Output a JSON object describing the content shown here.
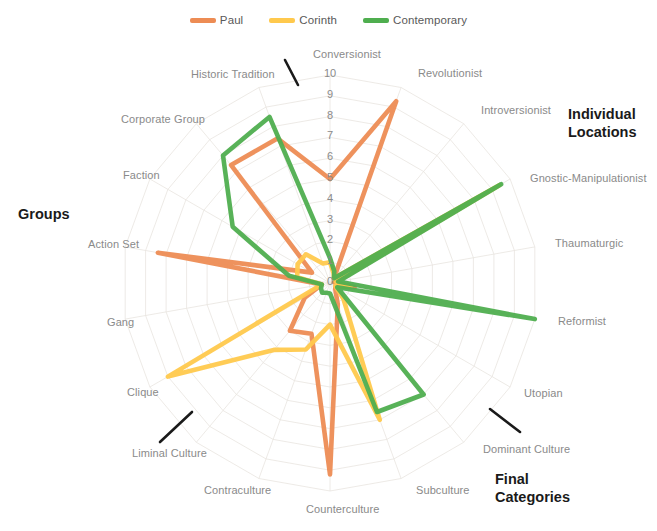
{
  "legend": {
    "position": "top-center",
    "items": [
      {
        "label": "Paul",
        "color": "#ED8C54"
      },
      {
        "label": "Corinth",
        "color": "#FFC94D"
      },
      {
        "label": "Contemporary",
        "color": "#4FAE4F"
      }
    ]
  },
  "sections": [
    {
      "key": "individual_locations",
      "label": "Individual Locations",
      "line1": "Individual",
      "line2": "Locations"
    },
    {
      "key": "final_categories",
      "label": "Final Categories",
      "line1": "Final",
      "line2": "Categories"
    },
    {
      "key": "groups",
      "label": "Groups",
      "line1": "Groups",
      "line2": ""
    }
  ],
  "ticks": [
    "0",
    "1",
    "2",
    "3",
    "4",
    "5",
    "6",
    "7",
    "8",
    "9",
    "10"
  ],
  "chart_data": {
    "type": "radar",
    "title": "",
    "subtitle": "",
    "xlabel": "",
    "ylabel": "",
    "rlim": [
      0,
      10
    ],
    "rticks": [
      0,
      1,
      2,
      3,
      4,
      5,
      6,
      7,
      8,
      9,
      10
    ],
    "grid": true,
    "legend_position": "top-center",
    "start_angle_deg": 90,
    "direction": "clockwise",
    "categories": [
      "Conversionist",
      "Revolutionist",
      "Introversionist",
      "Gnostic-Manipulationist",
      "Thaumaturgic",
      "Reformist",
      "Utopian",
      "Dominant Culture",
      "Subculture",
      "Counterculture",
      "Contraculture",
      "Liminal Culture",
      "Clique",
      "Gang",
      "Action Set",
      "Faction",
      "Corporate Group",
      "Historic Tradition"
    ],
    "series": [
      {
        "name": "Paul",
        "color": "#ED8C54",
        "values": [
          5,
          9.3,
          0.3,
          0.6,
          0.2,
          1.2,
          0.3,
          0.4,
          1.1,
          9.2,
          2.6,
          3.0,
          1.4,
          0.4,
          8.4,
          1.0,
          7.4,
          7.4
        ]
      },
      {
        "name": "Corinth",
        "color": "#FFC94D",
        "values": [
          1.0,
          0.5,
          0.3,
          9.4,
          0.3,
          1.0,
          0.3,
          1.0,
          7.0,
          2.0,
          3.4,
          4.2,
          9.0,
          0.4,
          1.6,
          1.8,
          1.8,
          1.0
        ]
      },
      {
        "name": "Contemporary",
        "color": "#4FAE4F",
        "values": [
          1.2,
          0.6,
          0.3,
          9.5,
          0.4,
          10.0,
          0.4,
          7.0,
          6.6,
          0.5,
          0.5,
          0.6,
          0.5,
          0.4,
          2.0,
          5.4,
          8.0,
          8.5
        ]
      }
    ]
  },
  "axis_label_positions": [
    {
      "name": "Conversionist",
      "x": 313,
      "y": 48,
      "align": "left"
    },
    {
      "name": "Revolutionist",
      "x": 418,
      "y": 67,
      "align": "left"
    },
    {
      "name": "Introversionist",
      "x": 481,
      "y": 104,
      "align": "left"
    },
    {
      "name": "Gnostic-Manipulationist",
      "x": 530,
      "y": 172,
      "align": "left"
    },
    {
      "name": "Thaumaturgic",
      "x": 555,
      "y": 237,
      "align": "left"
    },
    {
      "name": "Reformist",
      "x": 558,
      "y": 315,
      "align": "left"
    },
    {
      "name": "Utopian",
      "x": 524,
      "y": 387,
      "align": "left"
    },
    {
      "name": "Dominant Culture",
      "x": 483,
      "y": 443,
      "align": "left"
    },
    {
      "name": "Subculture",
      "x": 416,
      "y": 484,
      "align": "left"
    },
    {
      "name": "Counterculture",
      "x": 306,
      "y": 503,
      "align": "left"
    },
    {
      "name": "Contraculture",
      "x": 204,
      "y": 484,
      "align": "left"
    },
    {
      "name": "Liminal Culture",
      "x": 132,
      "y": 447,
      "align": "left"
    },
    {
      "name": "Clique",
      "x": 127,
      "y": 386,
      "align": "left"
    },
    {
      "name": "Gang",
      "x": 107,
      "y": 316,
      "align": "left"
    },
    {
      "name": "Action Set",
      "x": 88,
      "y": 238,
      "align": "left"
    },
    {
      "name": "Faction",
      "x": 123,
      "y": 169,
      "align": "left"
    },
    {
      "name": "Corporate Group",
      "x": 121,
      "y": 113,
      "align": "left"
    },
    {
      "name": "Historic Tradition",
      "x": 191,
      "y": 68,
      "align": "left"
    }
  ],
  "section_title_positions": [
    {
      "key": "individual_locations",
      "x": 568,
      "y": 105
    },
    {
      "key": "final_categories",
      "x": 495,
      "y": 470
    },
    {
      "key": "groups",
      "x": 18,
      "y": 205
    }
  ],
  "separators": [
    {
      "name": "separator-individual-locations",
      "x1": 285,
      "y1": 60,
      "x2": 298,
      "y2": 85
    },
    {
      "name": "separator-final-categories",
      "x1": 490,
      "y1": 409,
      "x2": 520,
      "y2": 432
    },
    {
      "name": "separator-groups",
      "x1": 160,
      "y1": 442,
      "x2": 192,
      "y2": 412
    }
  ],
  "geometry": {
    "center_x": 330,
    "center_y": 283,
    "radius": 208,
    "rings": 10
  },
  "colors": {
    "paul": "#ED8C54",
    "corinth": "#FFC94D",
    "contemporary": "#4FAE4F",
    "grid": "#E8E4E0",
    "label_text": "#8a8a8a",
    "section_text": "#1a1a1a",
    "separator": "#1a1a1a",
    "background": "#ffffff"
  }
}
